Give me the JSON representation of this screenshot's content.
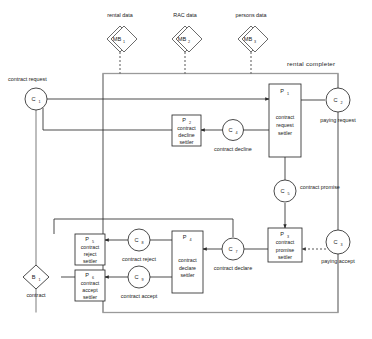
{
  "diagram": {
    "title": "rental completer",
    "scope_label": "rental completer",
    "colors": {
      "stroke": "#2b2b2b",
      "scope": "#9a9a9a",
      "background": "#ffffff"
    },
    "external_banks": [
      {
        "id": "MB",
        "sub": "1",
        "label": "rental data"
      },
      {
        "id": "MB",
        "sub": "2",
        "label": "RAC data"
      },
      {
        "id": "MB",
        "sub": "3",
        "label": "persons data"
      }
    ],
    "channels": [
      {
        "id": "C",
        "sub": "1",
        "label": "contract request"
      },
      {
        "id": "C",
        "sub": "2",
        "label": "paying request"
      },
      {
        "id": "C",
        "sub": "3",
        "label": "paying accept"
      },
      {
        "id": "C",
        "sub": "4",
        "label": "contract decline"
      },
      {
        "id": "C",
        "sub": "5",
        "label": "contract promise"
      },
      {
        "id": "C",
        "sub": "7",
        "label": "contract declare"
      },
      {
        "id": "C",
        "sub": "8",
        "label": "contract reject"
      },
      {
        "id": "C",
        "sub": "9",
        "label": "contract accept"
      }
    ],
    "processes": [
      {
        "id": "P",
        "sub": "1",
        "line1": "contract",
        "line2": "request",
        "line3": "settler"
      },
      {
        "id": "P",
        "sub": "2",
        "line1": "contract",
        "line2": "decline",
        "line3": "settler"
      },
      {
        "id": "P",
        "sub": "3",
        "line1": "contract",
        "line2": "promise",
        "line3": "settler"
      },
      {
        "id": "P",
        "sub": "4",
        "line1": "contract",
        "line2": "declare",
        "line3": "settler"
      },
      {
        "id": "P",
        "sub": "5",
        "line1": "contract",
        "line2": "reject",
        "line3": "settler"
      },
      {
        "id": "P",
        "sub": "6",
        "line1": "contract",
        "line2": "accept",
        "line3": "settler"
      }
    ],
    "banks": [
      {
        "id": "B",
        "sub": "1",
        "label": "contract"
      }
    ]
  }
}
